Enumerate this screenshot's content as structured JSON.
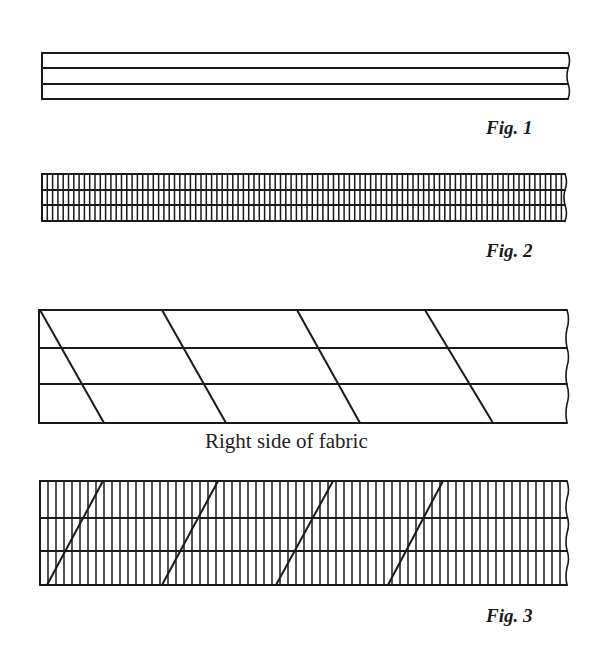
{
  "colors": {
    "ink": "#1a1a1a",
    "background": "#ffffff"
  },
  "figures": {
    "fig1": {
      "label": "Fig. 1",
      "label_pos": {
        "x": 486,
        "y": 117
      },
      "strip": {
        "x1": 42,
        "x2": 568,
        "y_top": 53,
        "y_bottom": 99,
        "inner_lines_y": [
          68,
          84
        ]
      },
      "vertical_spacing": 0,
      "diagonals": []
    },
    "fig2": {
      "label": "Fig. 2",
      "label_pos": {
        "x": 486,
        "y": 240
      },
      "strip": {
        "x1": 42,
        "x2": 565,
        "y_top": 174,
        "y_bottom": 221,
        "inner_lines_y": [
          190,
          205
        ]
      },
      "vertical_spacing": 5.3,
      "diagonals": []
    },
    "fig3_top": {
      "caption": "Right side of fabric",
      "caption_pos": {
        "x": 205,
        "y": 429
      },
      "strip": {
        "x1": 39,
        "x2": 567,
        "y_top": 310,
        "y_bottom": 423,
        "inner_lines_y": [
          348,
          384
        ]
      },
      "vertical_spacing": 0,
      "diagonals": [
        {
          "x_top": 40,
          "x_bottom": 104
        },
        {
          "x_top": 162,
          "x_bottom": 226
        },
        {
          "x_top": 297,
          "x_bottom": 360
        },
        {
          "x_top": 425,
          "x_bottom": 493
        }
      ]
    },
    "fig3_bottom": {
      "label": "Fig. 3",
      "label_pos": {
        "x": 486,
        "y": 605
      },
      "strip": {
        "x1": 40,
        "x2": 567,
        "y_top": 481,
        "y_bottom": 585,
        "inner_lines_y": [
          518,
          551
        ]
      },
      "vertical_spacing": 8,
      "diagonals": [
        {
          "x_top": 103,
          "x_bottom": 47
        },
        {
          "x_top": 218,
          "x_bottom": 162
        },
        {
          "x_top": 333,
          "x_bottom": 276
        },
        {
          "x_top": 443,
          "x_bottom": 388
        }
      ]
    }
  }
}
